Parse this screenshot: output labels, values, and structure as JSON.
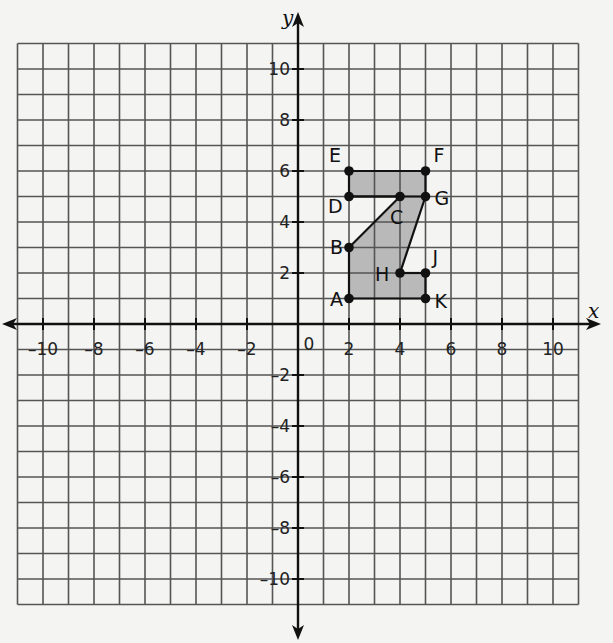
{
  "chart_data": {
    "type": "scatter",
    "title": "",
    "xlabel": "x",
    "ylabel": "y",
    "xlim": [
      -11,
      11
    ],
    "ylim": [
      -11,
      11
    ],
    "grid": true,
    "x_ticks": [
      -10,
      -8,
      -6,
      -4,
      -2,
      2,
      4,
      6,
      8,
      10
    ],
    "y_ticks": [
      -10,
      -8,
      -6,
      -4,
      -2,
      2,
      4,
      6,
      8,
      10
    ],
    "origin_label": "0",
    "points": [
      {
        "label": "A",
        "x": 2,
        "y": 1
      },
      {
        "label": "B",
        "x": 2,
        "y": 3
      },
      {
        "label": "C",
        "x": 4,
        "y": 5
      },
      {
        "label": "D",
        "x": 2,
        "y": 5
      },
      {
        "label": "E",
        "x": 2,
        "y": 6
      },
      {
        "label": "F",
        "x": 5,
        "y": 6
      },
      {
        "label": "G",
        "x": 5,
        "y": 5
      },
      {
        "label": "H",
        "x": 4,
        "y": 2
      },
      {
        "label": "J",
        "x": 5,
        "y": 2
      },
      {
        "label": "K",
        "x": 5,
        "y": 1
      }
    ],
    "shaded_polygon": {
      "vertices": [
        [
          2,
          1
        ],
        [
          2,
          3
        ],
        [
          4,
          5
        ],
        [
          2,
          5
        ],
        [
          2,
          6
        ],
        [
          5,
          6
        ],
        [
          5,
          5
        ],
        [
          4,
          2
        ],
        [
          5,
          2
        ],
        [
          5,
          1
        ]
      ],
      "order": [
        "A",
        "B",
        "C",
        "D",
        "E",
        "F",
        "G",
        "H",
        "J",
        "K"
      ],
      "fill": "#b9b9b9"
    },
    "segments": [
      [
        "A",
        "B"
      ],
      [
        "B",
        "C"
      ],
      [
        "C",
        "D"
      ],
      [
        "D",
        "E"
      ],
      [
        "E",
        "F"
      ],
      [
        "F",
        "G"
      ],
      [
        "G",
        "H"
      ],
      [
        "H",
        "J"
      ],
      [
        "J",
        "K"
      ],
      [
        "K",
        "A"
      ],
      [
        "D",
        "G"
      ]
    ]
  },
  "colors": {
    "background": "#f4f4f2",
    "grid": "#555555",
    "axis": "#111111",
    "shade": "#b9b9b9"
  }
}
